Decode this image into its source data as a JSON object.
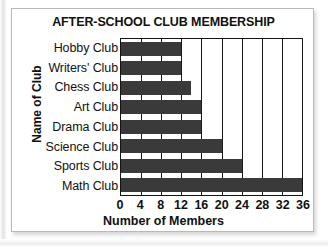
{
  "chart_data": {
    "type": "bar",
    "orientation": "horizontal",
    "title": "AFTER-SCHOOL CLUB MEMBERSHIP",
    "xlabel": "Number of Members",
    "ylabel": "Name of Club",
    "categories": [
      "Hobby Club",
      "Writers' Club",
      "Chess Club",
      "Art Club",
      "Drama Club",
      "Science Club",
      "Sports Club",
      "Math Club"
    ],
    "values": [
      12,
      12,
      14,
      16,
      16,
      20,
      24,
      36
    ],
    "xticks": [
      0,
      4,
      8,
      12,
      16,
      20,
      24,
      28,
      32,
      36
    ],
    "xlim": [
      0,
      36
    ],
    "grid": "vertical",
    "legend": "none",
    "bar_color": "#3a3a3a",
    "axis_color": "#141414",
    "background_color": "#ffffff"
  }
}
